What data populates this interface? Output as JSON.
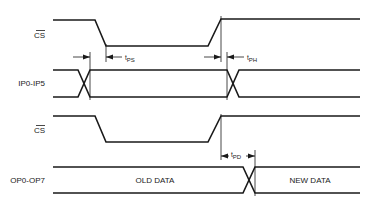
{
  "diagram": {
    "type": "timing-diagram",
    "signals": [
      {
        "id": "cs1",
        "label": "CS",
        "overbar": true
      },
      {
        "id": "ip",
        "label": "IP0-IP5"
      },
      {
        "id": "cs2",
        "label": "CS",
        "overbar": true
      },
      {
        "id": "op",
        "label": "OP0-OP7"
      }
    ],
    "timing_params": {
      "tps": {
        "prefix": "t",
        "sub": "PS"
      },
      "tph": {
        "prefix": "t",
        "sub": "PH"
      },
      "tpd": {
        "prefix": "t",
        "sub": "PD"
      }
    },
    "data_labels": {
      "old": "OLD DATA",
      "new": "NEW DATA"
    }
  }
}
